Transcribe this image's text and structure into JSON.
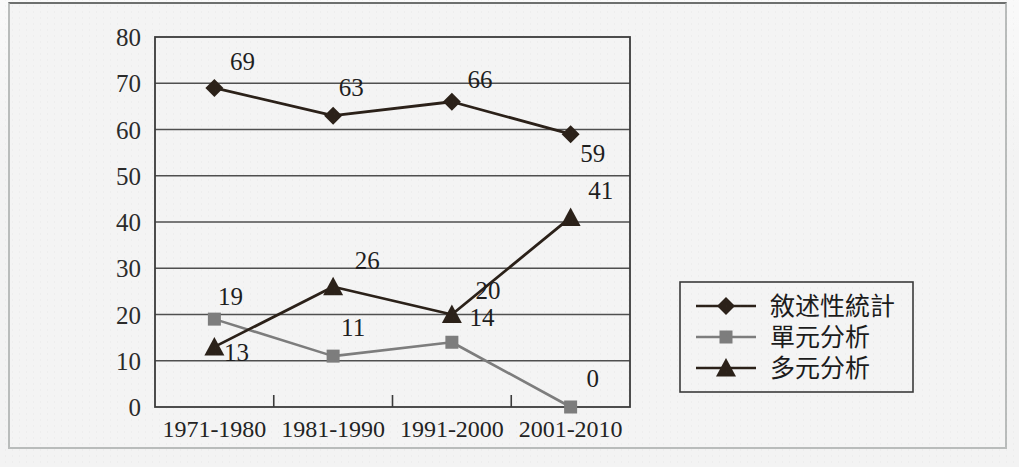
{
  "chart_data": {
    "type": "line",
    "title": "",
    "xlabel": "",
    "ylabel": "",
    "categories": [
      "1971-1980",
      "1981-1990",
      "1991-2000",
      "2001-2010"
    ],
    "series": [
      {
        "name": "敘述性統計",
        "marker": "diamond",
        "color": "#2b2119",
        "values": [
          69,
          63,
          66,
          59
        ]
      },
      {
        "name": "單元分析",
        "marker": "square",
        "color": "#7d7d7d",
        "values": [
          19,
          11,
          14,
          0
        ]
      },
      {
        "name": "多元分析",
        "marker": "triangle",
        "color": "#2b2119",
        "values": [
          13,
          26,
          20,
          41
        ]
      }
    ],
    "ylim": [
      0,
      80
    ],
    "yticks": [
      0,
      10,
      20,
      30,
      40,
      50,
      60,
      70,
      80
    ],
    "grid": true,
    "legend_position": "right",
    "data_labels": {
      "series_0": [
        "69",
        "63",
        "66",
        "59"
      ],
      "series_1": [
        "19",
        "11",
        "14",
        "0"
      ],
      "series_2": [
        "13",
        "26",
        "20",
        "41"
      ]
    }
  },
  "legend": {
    "items": [
      {
        "label": "敘述性統計"
      },
      {
        "label": "單元分析"
      },
      {
        "label": "多元分析"
      }
    ]
  },
  "axes": {
    "y_tick_labels": [
      "80",
      "70",
      "60",
      "50",
      "40",
      "30",
      "20",
      "10",
      "0"
    ],
    "x_tick_labels": [
      "1971-1980",
      "1981-1990",
      "1991-2000",
      "2001-2010"
    ]
  },
  "colors": {
    "dark_series": "#2b2119",
    "gray_series": "#7d7d7d",
    "gridline": "#4f4f4f",
    "frame": "#3b3b3b",
    "background": "#f4f4f4"
  }
}
